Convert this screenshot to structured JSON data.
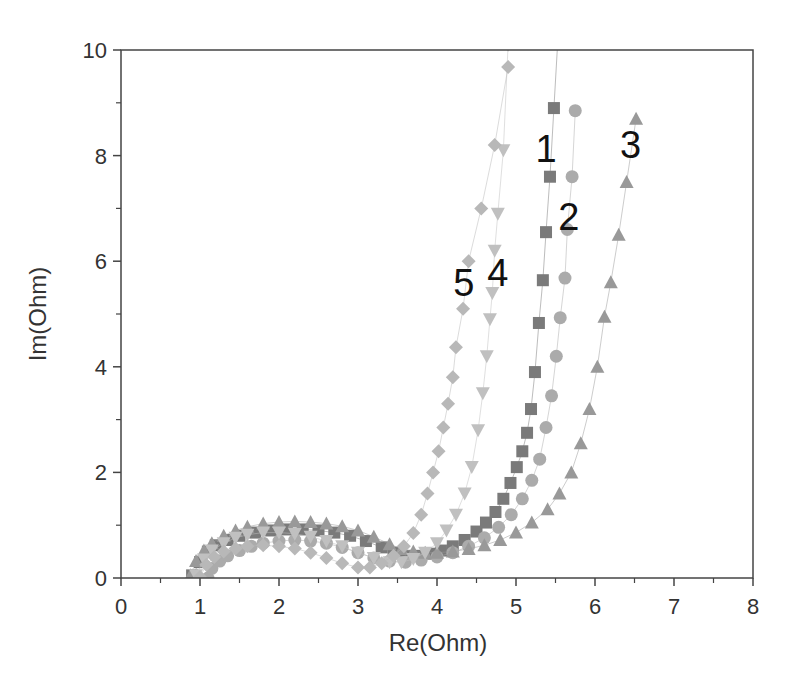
{
  "chart_data": {
    "type": "scatter",
    "title": "",
    "xlabel": "Re(Ohm)",
    "ylabel": "Im(Ohm)",
    "xlim": [
      0,
      8
    ],
    "ylim": [
      0,
      10
    ],
    "x_ticks": [
      0,
      1,
      2,
      3,
      4,
      5,
      6,
      7,
      8
    ],
    "y_ticks": [
      0,
      2,
      4,
      6,
      8,
      10
    ],
    "grid": false,
    "legend": "none (curves labeled inline with numbers 1-5)",
    "annotations": [
      {
        "text": "1",
        "x": 5.38,
        "y": 8.15
      },
      {
        "text": "2",
        "x": 5.67,
        "y": 6.85
      },
      {
        "text": "3",
        "x": 6.45,
        "y": 8.22
      },
      {
        "text": "4",
        "x": 4.77,
        "y": 5.8
      },
      {
        "text": "5",
        "x": 4.34,
        "y": 5.6
      }
    ],
    "series": [
      {
        "name": "1",
        "marker": "square",
        "color": "#7a7a7a",
        "x": [
          0.9,
          1.0,
          1.1,
          1.2,
          1.35,
          1.5,
          1.7,
          1.9,
          2.1,
          2.3,
          2.5,
          2.7,
          2.9,
          3.1,
          3.3,
          3.45,
          3.6,
          3.75,
          3.9,
          4.05,
          4.2,
          4.35,
          4.5,
          4.62,
          4.74,
          4.84,
          4.93,
          5.01,
          5.08,
          5.14,
          5.19,
          5.24,
          5.29,
          5.34,
          5.38,
          5.43,
          5.48,
          5.53
        ],
        "y": [
          0.05,
          0.3,
          0.5,
          0.62,
          0.72,
          0.8,
          0.86,
          0.9,
          0.92,
          0.92,
          0.9,
          0.86,
          0.8,
          0.7,
          0.58,
          0.48,
          0.42,
          0.42,
          0.46,
          0.52,
          0.6,
          0.72,
          0.88,
          1.05,
          1.25,
          1.5,
          1.8,
          2.1,
          2.4,
          2.75,
          3.2,
          3.9,
          4.83,
          5.64,
          6.55,
          7.6,
          8.9,
          10.2
        ]
      },
      {
        "name": "2",
        "marker": "circle",
        "color": "#ababab",
        "x": [
          1.1,
          1.15,
          1.25,
          1.35,
          1.5,
          1.65,
          1.8,
          2.0,
          2.2,
          2.4,
          2.6,
          2.8,
          3.0,
          3.2,
          3.4,
          3.6,
          3.8,
          4.0,
          4.2,
          4.4,
          4.6,
          4.78,
          4.94,
          5.08,
          5.2,
          5.3,
          5.38,
          5.45,
          5.51,
          5.56,
          5.62,
          5.65,
          5.71,
          5.75
        ],
        "y": [
          0.0,
          0.18,
          0.32,
          0.42,
          0.52,
          0.6,
          0.66,
          0.7,
          0.72,
          0.7,
          0.66,
          0.58,
          0.48,
          0.38,
          0.32,
          0.3,
          0.34,
          0.4,
          0.48,
          0.6,
          0.76,
          0.96,
          1.2,
          1.5,
          1.85,
          2.25,
          2.85,
          3.45,
          4.2,
          4.93,
          5.68,
          6.6,
          7.6,
          8.85
        ]
      },
      {
        "name": "3",
        "marker": "triangle-up",
        "color": "#999999",
        "x": [
          0.88,
          0.95,
          1.05,
          1.15,
          1.3,
          1.45,
          1.6,
          1.8,
          2.0,
          2.2,
          2.4,
          2.6,
          2.8,
          3.0,
          3.2,
          3.4,
          3.55,
          3.7,
          3.85,
          4.0,
          4.2,
          4.4,
          4.6,
          4.8,
          5.0,
          5.2,
          5.4,
          5.55,
          5.7,
          5.82,
          5.93,
          6.03,
          6.12,
          6.2,
          6.3,
          6.4,
          6.52
        ],
        "y": [
          0.05,
          0.32,
          0.52,
          0.66,
          0.8,
          0.9,
          0.97,
          1.03,
          1.06,
          1.07,
          1.06,
          1.03,
          0.98,
          0.9,
          0.78,
          0.64,
          0.55,
          0.5,
          0.48,
          0.48,
          0.5,
          0.55,
          0.62,
          0.72,
          0.86,
          1.05,
          1.3,
          1.6,
          2.0,
          2.55,
          3.2,
          4.0,
          4.95,
          5.6,
          6.5,
          7.5,
          8.7
        ]
      },
      {
        "name": "4",
        "marker": "triangle-down",
        "color": "#c0c0c0",
        "x": [
          0.95,
          1.05,
          1.15,
          1.3,
          1.45,
          1.6,
          1.8,
          2.0,
          2.2,
          2.4,
          2.6,
          2.8,
          3.0,
          3.2,
          3.4,
          3.55,
          3.7,
          3.85,
          4.0,
          4.12,
          4.24,
          4.35,
          4.44,
          4.52,
          4.58,
          4.63,
          4.67,
          4.7,
          4.73,
          4.77,
          4.84,
          4.9
        ],
        "y": [
          0.05,
          0.35,
          0.52,
          0.66,
          0.76,
          0.82,
          0.86,
          0.86,
          0.84,
          0.78,
          0.7,
          0.6,
          0.48,
          0.38,
          0.3,
          0.3,
          0.36,
          0.48,
          0.66,
          0.9,
          1.2,
          1.6,
          2.1,
          2.8,
          3.5,
          4.2,
          4.9,
          5.4,
          6.2,
          6.9,
          8.1,
          10.1
        ]
      },
      {
        "name": "5",
        "marker": "diamond",
        "color": "#b8b8b8",
        "x": [
          1.0,
          1.08,
          1.18,
          1.3,
          1.45,
          1.6,
          1.8,
          2.0,
          2.2,
          2.4,
          2.6,
          2.8,
          3.0,
          3.15,
          3.3,
          3.45,
          3.58,
          3.7,
          3.8,
          3.88,
          3.95,
          4.02,
          4.08,
          4.14,
          4.2,
          4.24,
          4.33,
          4.4,
          4.56,
          4.73,
          4.9
        ],
        "y": [
          0.02,
          0.25,
          0.4,
          0.5,
          0.56,
          0.6,
          0.62,
          0.6,
          0.56,
          0.48,
          0.38,
          0.28,
          0.2,
          0.2,
          0.28,
          0.42,
          0.6,
          0.85,
          1.2,
          1.6,
          2.0,
          2.4,
          2.85,
          3.3,
          3.8,
          4.37,
          5.1,
          6.0,
          7.0,
          8.2,
          9.68
        ]
      }
    ]
  }
}
